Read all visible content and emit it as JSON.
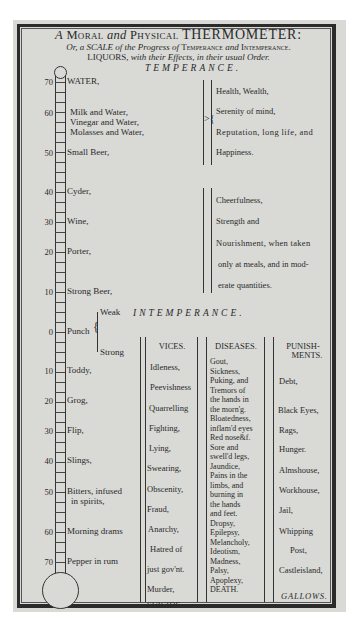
{
  "document": {
    "title_line1": {
      "prefix": "A",
      "moral": "Moral",
      "and1": "and",
      "physical": "Physical",
      "main": "THERMOMETER:"
    },
    "title_line2": {
      "text_a": "Or, a SCALE of the Progress of",
      "temperance": "Temperance",
      "and": "and",
      "intemperance": "Intemperance."
    },
    "title_line3": {
      "liquors": "LIQUORS,",
      "rest": "with their Effects, in their usual Order."
    },
    "sections": {
      "temperance": "TEMPERANCE.",
      "intemperance": "INTEMPERANCE."
    }
  },
  "scale": {
    "temperance": [
      {
        "degree": "70",
        "liquor": "WATER,"
      },
      {
        "degree": "60",
        "liquor": "Milk and Water,",
        "extra": [
          "Vinegar and Water,",
          "Molasses and Water,"
        ]
      },
      {
        "degree": "50",
        "liquor": "Small Beer,"
      },
      {
        "degree": "40",
        "liquor": "Cyder,"
      },
      {
        "degree": "30",
        "liquor": "Wine,"
      },
      {
        "degree": "20",
        "liquor": "Porter,"
      },
      {
        "degree": "10",
        "liquor": "Strong Beer,"
      }
    ],
    "punch": {
      "degree": "0",
      "liquor": "Punch",
      "weak": "Weak",
      "strong": "Strong"
    },
    "intemperance": [
      {
        "degree": "10",
        "liquor": "Toddy,"
      },
      {
        "degree": "20",
        "liquor": "Grog,"
      },
      {
        "degree": "30",
        "liquor": "Flip,"
      },
      {
        "degree": "40",
        "liquor": "Slings,"
      },
      {
        "degree": "50",
        "liquor": "Bitters, infused",
        "liquor2": "in spirits,"
      },
      {
        "degree": "60",
        "liquor": "Morning drams"
      },
      {
        "degree": "70",
        "liquor": "Pepper in rum"
      }
    ]
  },
  "effects": {
    "temperance_1": [
      "Health, Wealth,",
      "Serenity of mind,",
      "Reputation, long life, and",
      "Happiness."
    ],
    "temperance_2": [
      "Cheerfulness,",
      "Strength and",
      "Nourishment, when taken",
      "only at meals, and in mod-",
      "erate quantities."
    ]
  },
  "columns": {
    "vices": {
      "header": "VICES.",
      "items": [
        "Idleness,",
        "Peevishness",
        "Quarrelling",
        "Fighting,",
        "Lying,",
        "Swearing,",
        "Obscenity,",
        "Fraud,",
        "Anarchy,",
        "Hatred of",
        "just gov'nt.",
        "Murder,",
        "SUICIDE."
      ]
    },
    "diseases": {
      "header": "DISEASES.",
      "items": [
        "Gout,",
        "Sickness,",
        "Puking, and",
        "Tremors of",
        "the hands in",
        "the morn'g.",
        "Bloatedness,",
        "inflam'd eyes",
        "Red nose&f.",
        "Sore and",
        "swell'd legs,",
        "Jaundice,",
        "Pains in the",
        "limbs, and",
        "burning in",
        "the hands",
        "and feet.",
        "Dropsy,",
        "Epilepsy,",
        "Melancholy,",
        "Ideotism,",
        "Madness,",
        "Palsy,",
        "Apoplexy,",
        "DEATH."
      ]
    },
    "punishments": {
      "header_1": "PUNISH-",
      "header_2": "MENTS.",
      "items": [
        "Debt,",
        "Black Eyes,",
        "Rags,",
        "Hunger.",
        "Almshouse,",
        "Workhouse,",
        "Jail,",
        "Whipping",
        "Post,",
        "Castleisland,",
        "GALLOWS."
      ]
    }
  }
}
